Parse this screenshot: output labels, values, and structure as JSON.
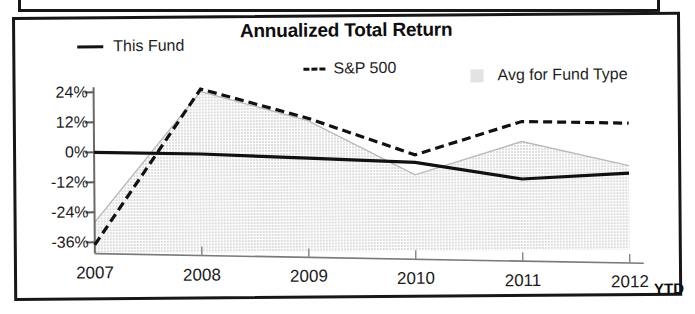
{
  "chart": {
    "title": "Annualized Total Return",
    "legend": [
      {
        "label": "This Fund",
        "marker": "solid-line-swatch"
      },
      {
        "label": "S&P 500",
        "marker": "dashed-line-swatch"
      },
      {
        "label": "Avg for Fund Type",
        "marker": "area-fill-swatch"
      }
    ],
    "x_suffix_label": "YTD"
  },
  "chart_data": {
    "type": "line",
    "title": "Annualized Total Return",
    "subtitle": "",
    "xlabel": "",
    "ylabel": "",
    "categories": [
      "2007",
      "2008",
      "2009",
      "2010",
      "2011",
      "2012"
    ],
    "x_tick_labels": [
      "2007",
      "2008",
      "2009",
      "2010",
      "2011",
      "2012"
    ],
    "x_axis_note": "YTD",
    "y_tick_labels": [
      "24%",
      "12%",
      "0%",
      "-12%",
      "-24%",
      "-36%"
    ],
    "y_tick_values": [
      24,
      12,
      0,
      -12,
      -24,
      -36
    ],
    "ylim": [
      -40,
      28
    ],
    "grid": false,
    "legend_position": "top",
    "series": [
      {
        "name": "This Fund",
        "style": "solid",
        "color": "#111111",
        "values": [
          0,
          -1,
          -3,
          -5,
          -12,
          -10
        ]
      },
      {
        "name": "S&P 500",
        "style": "dashed",
        "color": "#111111",
        "values": [
          -37,
          25,
          13,
          -2,
          11,
          10
        ]
      },
      {
        "name": "Avg for Fund Type",
        "style": "area",
        "color": "#e3e3e3",
        "values": [
          -28,
          24,
          12,
          -10,
          3,
          -7
        ]
      }
    ]
  },
  "colors": {
    "line": "#111111",
    "area_fill": "#e3e3e3",
    "axis": "#4a4a4a",
    "frame": "#171717",
    "text": "#1b1b1b"
  }
}
